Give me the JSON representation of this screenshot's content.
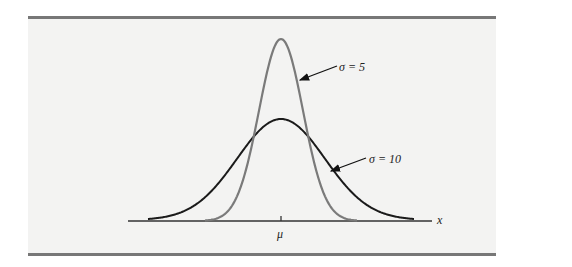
{
  "chart_data": {
    "type": "line",
    "xlabel": "x",
    "ylabel": "",
    "x_ticks": [
      "μ"
    ],
    "series": [
      {
        "name": "σ = 5",
        "color": "#777777",
        "mean": "μ",
        "std": 5,
        "label": "σ = 5"
      },
      {
        "name": "σ = 10",
        "color": "#1a1a1a",
        "mean": "μ",
        "std": 10,
        "label": "σ = 10"
      }
    ],
    "annotations": [
      {
        "text": "σ = 5",
        "points_to": "σ = 5 curve"
      },
      {
        "text": "σ = 10",
        "points_to": "σ = 10 curve"
      }
    ],
    "grid": false,
    "legend": "none (arrow annotations)"
  },
  "labels": {
    "sigma5": "σ = 5",
    "sigma10": "σ = 10",
    "mu": "μ",
    "x": "x"
  }
}
